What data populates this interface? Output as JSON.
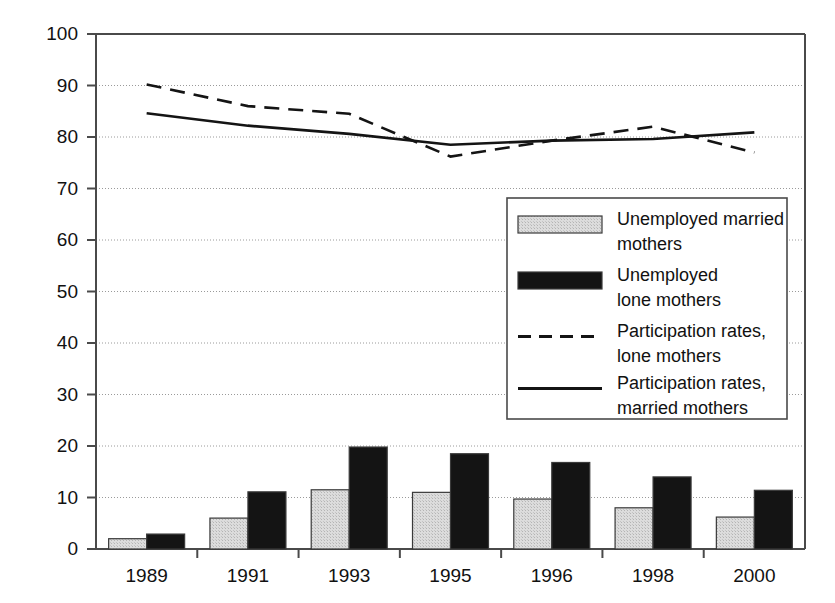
{
  "chart_data": {
    "type": "bar",
    "title": "",
    "subtitle": "",
    "xlabel": "",
    "ylabel": "",
    "ylim": [
      0,
      100
    ],
    "ytick_step": 10,
    "yticks": [
      "0",
      "10",
      "20",
      "30",
      "40",
      "50",
      "60",
      "70",
      "80",
      "90",
      "100"
    ],
    "grid": true,
    "grid_style": "dotted-horizontal",
    "categories": [
      "1989",
      "1991",
      "1993",
      "1995",
      "1996",
      "1998",
      "2000"
    ],
    "legend_position": "center-right",
    "series": [
      {
        "name": "Unemployed married mothers",
        "type": "bar",
        "style": "filled-light-gray-stipple",
        "color": "#d2d2d2",
        "values": [
          2.0,
          6.0,
          11.5,
          11.0,
          9.7,
          8.0,
          6.2
        ]
      },
      {
        "name": "Unemployed lone mothers",
        "type": "bar",
        "style": "filled-black",
        "color": "#141414",
        "values": [
          2.9,
          11.1,
          19.8,
          18.5,
          16.8,
          14.0,
          11.4
        ]
      },
      {
        "name": "Participation rates, lone mothers",
        "type": "line",
        "style": "dashed",
        "color": "#141414",
        "values": [
          90.2,
          86.0,
          84.5,
          76.2,
          79.3,
          82.0,
          77.0
        ]
      },
      {
        "name": "Participation rates, married mothers",
        "type": "line",
        "style": "solid",
        "color": "#141414",
        "values": [
          84.6,
          82.2,
          80.6,
          78.5,
          79.3,
          79.6,
          80.9
        ]
      }
    ]
  },
  "legend": {
    "entries": [
      {
        "label_line1": "Unemployed married",
        "label_line2": "mothers",
        "swatch": "light-gray-bar"
      },
      {
        "label_line1": "Unemployed",
        "label_line2": "lone mothers",
        "swatch": "black-bar"
      },
      {
        "label_line1": "Participation rates,",
        "label_line2": "lone mothers",
        "swatch": "dashed-line"
      },
      {
        "label_line1": "Participation rates,",
        "label_line2": "married mothers",
        "swatch": "solid-line"
      }
    ]
  },
  "colors": {
    "axis": "#4a4a4a",
    "grid": "#9a9a9a",
    "bar_gray": "#d2d2d2",
    "bar_black": "#141414",
    "line": "#141414",
    "text": "#111111",
    "background": "#ffffff"
  }
}
